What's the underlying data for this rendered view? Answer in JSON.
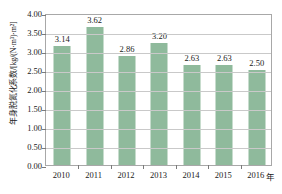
{
  "chart_data": {
    "type": "bar",
    "title": "",
    "categories": [
      "2010",
      "2011",
      "2012",
      "2013",
      "2014",
      "2015",
      "2016"
    ],
    "values": [
      3.14,
      3.62,
      2.86,
      3.2,
      2.63,
      2.63,
      2.5
    ],
    "data_labels": [
      "3.14",
      "3.62",
      "2.86",
      "3.20",
      "2.63",
      "2.63",
      "2.50"
    ],
    "xlabel": "年",
    "ylabel": "年身脱氮化系数/[kg/(N·m³)·m²]",
    "ylim": [
      0.0,
      4.0
    ],
    "ytick_values": [
      0.0,
      0.5,
      1.0,
      1.5,
      2.0,
      2.5,
      3.0,
      3.5,
      4.0
    ],
    "ytick_labels": [
      "0.00",
      "0.50",
      "1.00",
      "1.50",
      "2.00",
      "2.50",
      "3.00",
      "3.50",
      "4.00"
    ],
    "grid": true,
    "legend": null,
    "series_color": "#8fba9c",
    "gridline_color": "#c9c9c9",
    "frame_color": "#a8a8a8",
    "text_color": "#1a1a1a"
  }
}
